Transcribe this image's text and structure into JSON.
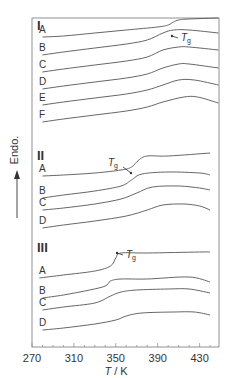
{
  "chart_data": {
    "type": "line",
    "title": "",
    "xlabel": "T / K",
    "ylabel": "Endo.",
    "xlim": [
      270,
      448
    ],
    "xticks": [
      270,
      310,
      350,
      390,
      430
    ],
    "grid": false,
    "annotation_label": "Tg",
    "panels": [
      {
        "label": "I",
        "tg_annotation": {
          "x": 408,
          "series": "A"
        },
        "series": [
          {
            "name": "A",
            "x": [
              280,
              300,
              330,
              360,
              390,
              400,
              405,
              410,
              420,
              448
            ],
            "y_px": [
              37,
              36,
              33,
              30,
              27,
              25,
              22,
              20,
              19,
              18
            ]
          },
          {
            "name": "B",
            "x": [
              280,
              300,
              330,
              360,
              380,
              395,
              405,
              420,
              448
            ],
            "y_px": [
              55,
              52,
              48,
              44,
              40,
              33,
              30,
              30,
              33
            ]
          },
          {
            "name": "C",
            "x": [
              280,
              300,
              330,
              360,
              380,
              395,
              410,
              420,
              448
            ],
            "y_px": [
              72,
              69,
              65,
              61,
              57,
              50,
              47,
              47,
              50
            ]
          },
          {
            "name": "D",
            "x": [
              280,
              300,
              330,
              360,
              380,
              395,
              410,
              420,
              448
            ],
            "y_px": [
              89,
              86,
              82,
              78,
              74,
              68,
              64,
              64,
              68
            ]
          },
          {
            "name": "E",
            "x": [
              280,
              300,
              330,
              360,
              380,
              395,
              410,
              425,
              448
            ],
            "y_px": [
              105,
              102,
              98,
              94,
              90,
              85,
              80,
              80,
              85
            ]
          },
          {
            "name": "F",
            "x": [
              280,
              300,
              330,
              360,
              380,
              395,
              415,
              428,
              448
            ],
            "y_px": [
              122,
              119,
              115,
              111,
              107,
              102,
              97,
              97,
              103
            ]
          }
        ]
      },
      {
        "label": "II",
        "tg_annotation": {
          "x": 367,
          "series": "A"
        },
        "series": [
          {
            "name": "A",
            "x": [
              280,
              300,
              330,
              355,
              365,
              372,
              380,
              400,
              440
            ],
            "y_px": [
              176,
              175,
              173,
              170,
              167,
              160,
              156,
              156,
              153
            ]
          },
          {
            "name": "B",
            "x": [
              280,
              300,
              330,
              355,
              365,
              375,
              400,
              430,
              440
            ],
            "y_px": [
              198,
              195,
              191,
              186,
              180,
              174,
              172,
              173,
              175
            ]
          },
          {
            "name": "C",
            "x": [
              280,
              300,
              330,
              355,
              370,
              385,
              410,
              430,
              440
            ],
            "y_px": [
              210,
              208,
              204,
              199,
              193,
              187,
              186,
              188,
              190
            ]
          },
          {
            "name": "D",
            "x": [
              280,
              300,
              330,
              360,
              380,
              395,
              415,
              430,
              440
            ],
            "y_px": [
              228,
              225,
              221,
              216,
              210,
              205,
              204,
              206,
              210
            ]
          }
        ]
      },
      {
        "label": "III",
        "tg_annotation": {
          "x": 350,
          "series": "A"
        },
        "series": [
          {
            "name": "A",
            "x": [
              277,
              300,
              330,
              345,
              350,
              355,
              380,
              430,
              440
            ],
            "y_px": [
              278,
              275,
              271,
              266,
              258,
              253,
              253,
              252,
              252
            ]
          },
          {
            "name": "B",
            "x": [
              280,
              300,
              325,
              340,
              345,
              355,
              380,
              420,
              440
            ],
            "y_px": [
              298,
              295,
              290,
              286,
              281,
              279,
              279,
              277,
              282
            ]
          },
          {
            "name": "C",
            "x": [
              280,
              300,
              330,
              345,
              355,
              370,
              400,
              420,
              440
            ],
            "y_px": [
              310,
              307,
              303,
              296,
              292,
              290,
              289,
              289,
              293
            ]
          },
          {
            "name": "D",
            "x": [
              280,
              300,
              330,
              350,
              360,
              375,
              405,
              425,
              440
            ],
            "y_px": [
              330,
              328,
              324,
              320,
              316,
              313,
              312,
              312,
              315
            ]
          }
        ]
      }
    ]
  },
  "axis": {
    "xlabel_italic": "T",
    "xlabel_rest": " / K",
    "ylabel": "Endo.",
    "ticks": [
      "270",
      "310",
      "350",
      "390",
      "430"
    ]
  },
  "panels_labels": [
    "I",
    "II",
    "III"
  ],
  "tg": {
    "main": "T",
    "sub": "g"
  }
}
